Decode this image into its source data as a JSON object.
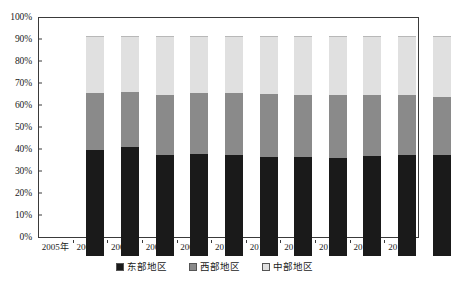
{
  "chart_data": {
    "type": "bar",
    "subtype": "stacked-percentage",
    "title": "",
    "xlabel": "",
    "ylabel": "",
    "ylim": [
      0,
      100
    ],
    "ytick_labels": [
      "0%",
      "10%",
      "20%",
      "30%",
      "40%",
      "50%",
      "60%",
      "70%",
      "80%",
      "90%",
      "100%"
    ],
    "ytick_values": [
      0,
      10,
      20,
      30,
      40,
      50,
      60,
      70,
      80,
      90,
      100
    ],
    "grid": false,
    "legend_position": "bottom-center",
    "categories": [
      "2005年",
      "2006年",
      "2007年",
      "2008年",
      "2009年",
      "2010年",
      "2011年",
      "2012年",
      "2013年",
      "2014年",
      "2015年"
    ],
    "series": [
      {
        "name": "东部地区",
        "color": "#1a1a1a",
        "values": [
          48.0,
          49.5,
          46.0,
          46.5,
          46.0,
          45.0,
          45.0,
          44.5,
          45.5,
          46.0,
          46.0
        ]
      },
      {
        "name": "西部地区",
        "color": "#8a8a8a",
        "values": [
          26.0,
          25.0,
          27.0,
          27.5,
          28.0,
          28.5,
          28.0,
          28.5,
          27.5,
          27.0,
          26.5
        ]
      },
      {
        "name": "中部地区",
        "color": "#e0e0e0",
        "values": [
          26.0,
          25.5,
          27.0,
          26.0,
          26.0,
          26.5,
          27.0,
          27.0,
          27.0,
          27.0,
          27.5
        ]
      }
    ]
  },
  "axis": {
    "frame_color": "#3a3a3a"
  },
  "legend": {
    "items": [
      {
        "label": "东部地区",
        "color": "#1a1a1a"
      },
      {
        "label": "西部地区",
        "color": "#8a8a8a"
      },
      {
        "label": "中部地区",
        "color": "#e0e0e0"
      }
    ]
  }
}
